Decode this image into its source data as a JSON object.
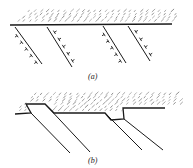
{
  "figure": {
    "panels": [
      {
        "id": "a",
        "label": "(a)",
        "description": "Flat surface with hatched material above; four inclined slip lines below carrying dislocation symbols",
        "surface_line": [
          [
            10,
            25
          ],
          [
            172,
            24
          ]
        ],
        "hatch_region": {
          "x1": 12,
          "x2": 176,
          "y_top": 9,
          "y_bottom": 24
        },
        "slip_lines": [
          {
            "from": [
              15,
              27
            ],
            "to": [
              42,
              64
            ],
            "dislocations": 5,
            "side": "left"
          },
          {
            "from": [
              47,
              27
            ],
            "to": [
              72,
              67
            ],
            "dislocations": 5,
            "side": "right"
          },
          {
            "from": [
              103,
              26
            ],
            "to": [
              126,
              63
            ],
            "dislocations": 5,
            "side": "left"
          },
          {
            "from": [
              128,
              26
            ],
            "to": [
              150,
              61
            ],
            "dislocations": 4,
            "side": "right"
          }
        ]
      },
      {
        "id": "b",
        "label": "(b)",
        "description": "Surface with slip steps after dislocations exit; four inclined slip lines, no dislocation symbols",
        "surface_path": [
          [
            15,
            114
          ],
          [
            31,
            113
          ],
          [
            26,
            104
          ],
          [
            45,
            104
          ],
          [
            54,
            113
          ],
          [
            105,
            113
          ],
          [
            111,
            120
          ],
          [
            124,
            119
          ],
          [
            123,
            108
          ],
          [
            165,
            108
          ]
        ],
        "hatch_region": {
          "x1": 12,
          "x2": 180,
          "y_top": 92,
          "y_bottom": 112
        },
        "slip_lines": [
          {
            "from": [
              31,
              113
            ],
            "to": [
              70,
              153
            ]
          },
          {
            "from": [
              45,
              104
            ],
            "to": [
              90,
              152
            ]
          },
          {
            "from": [
              105,
              113
            ],
            "to": [
              142,
              150
            ]
          },
          {
            "from": [
              124,
              119
            ],
            "to": [
              163,
              150
            ]
          }
        ]
      }
    ],
    "colors": {
      "ink": "#1a1a1a",
      "hatch": "#555555",
      "background": "#ffffff"
    }
  }
}
